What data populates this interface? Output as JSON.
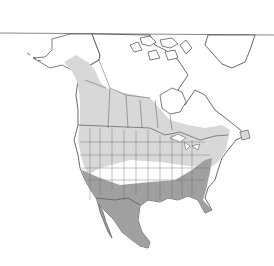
{
  "map": {
    "region": "North America",
    "type": "species range map",
    "colors": {
      "background": "#ffffff",
      "land": "#ffffff",
      "border": "#555555",
      "range_summer": "#d8d8d8",
      "range_yearround": "#a0a0a0",
      "frame_line": "#888888"
    },
    "legend": []
  }
}
